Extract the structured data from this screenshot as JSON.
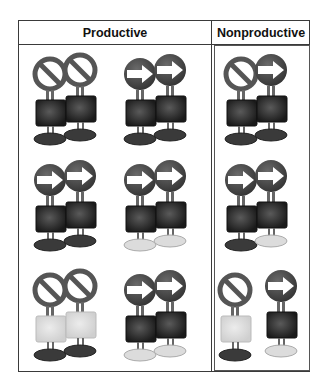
{
  "table": {
    "headers": {
      "productive": "Productive",
      "nonproductive": "Nonproductive"
    },
    "colors": {
      "dark_body": "#1e1e1e",
      "light_body": "#d4d4d4",
      "dark_foot": "#3a3a3a",
      "light_foot": "#dcdcdc",
      "sign_fill": "#4a4a4a",
      "border": "#3a3a3a"
    },
    "rows": [
      {
        "productive_a": {
          "figures": [
            {
              "sign": "no-entry",
              "body": "dark",
              "foot": "dark"
            },
            {
              "sign": "no-entry",
              "body": "dark",
              "foot": "dark"
            }
          ],
          "overlap": true
        },
        "productive_b": {
          "figures": [
            {
              "sign": "arrow-right",
              "body": "dark",
              "foot": "dark"
            },
            {
              "sign": "arrow-right",
              "body": "dark",
              "foot": "dark"
            }
          ],
          "overlap": true
        },
        "nonproductive": {
          "figures": [
            {
              "sign": "no-entry",
              "body": "dark",
              "foot": "dark"
            },
            {
              "sign": "arrow-right",
              "body": "dark",
              "foot": "dark"
            }
          ],
          "overlap": true
        }
      },
      {
        "productive_a": {
          "figures": [
            {
              "sign": "arrow-right",
              "body": "dark",
              "foot": "dark"
            },
            {
              "sign": "arrow-right",
              "body": "dark",
              "foot": "dark"
            }
          ],
          "overlap": true
        },
        "productive_b": {
          "figures": [
            {
              "sign": "arrow-right",
              "body": "dark",
              "foot": "light"
            },
            {
              "sign": "arrow-right",
              "body": "dark",
              "foot": "light"
            }
          ],
          "overlap": true
        },
        "nonproductive": {
          "figures": [
            {
              "sign": "arrow-right",
              "body": "dark",
              "foot": "dark"
            },
            {
              "sign": "arrow-right",
              "body": "dark",
              "foot": "light"
            }
          ],
          "overlap": true
        }
      },
      {
        "productive_a": {
          "figures": [
            {
              "sign": "no-entry",
              "body": "light",
              "foot": "dark"
            },
            {
              "sign": "no-entry",
              "body": "light",
              "foot": "dark"
            }
          ],
          "overlap": true
        },
        "productive_b": {
          "figures": [
            {
              "sign": "arrow-right",
              "body": "dark",
              "foot": "light"
            },
            {
              "sign": "arrow-right",
              "body": "dark",
              "foot": "light"
            }
          ],
          "overlap": true
        },
        "nonproductive": {
          "figures": [
            {
              "sign": "no-entry",
              "body": "light",
              "foot": "dark"
            },
            {
              "sign": "arrow-right",
              "body": "dark",
              "foot": "light"
            }
          ],
          "overlap": false
        }
      }
    ]
  }
}
